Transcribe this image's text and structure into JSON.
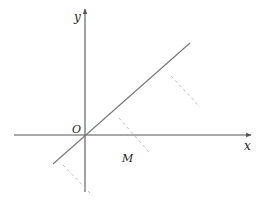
{
  "diagram": {
    "type": "coordinate-plane",
    "labels": {
      "y_axis": "y",
      "x_axis": "x",
      "origin": "O",
      "point_m": "M"
    },
    "colors": {
      "axis": "#555555",
      "line": "#777777",
      "dashed": "#bbbbbb",
      "text": "#222222"
    },
    "elements": {
      "x_axis": {
        "from": [
          14,
          135
        ],
        "to": [
          250,
          135
        ]
      },
      "y_axis": {
        "from": [
          85,
          192
        ],
        "to": [
          85,
          10
        ]
      },
      "line": {
        "from": [
          53,
          164
        ],
        "to": [
          190,
          43
        ]
      },
      "dashed_segments": [
        {
          "from": [
            171,
            76
          ],
          "to": [
            200,
            107
          ]
        },
        {
          "from": [
            119,
            118
          ],
          "to": [
            149,
            152
          ]
        },
        {
          "from": [
            63,
            165
          ],
          "to": [
            91,
            194
          ]
        }
      ]
    }
  }
}
